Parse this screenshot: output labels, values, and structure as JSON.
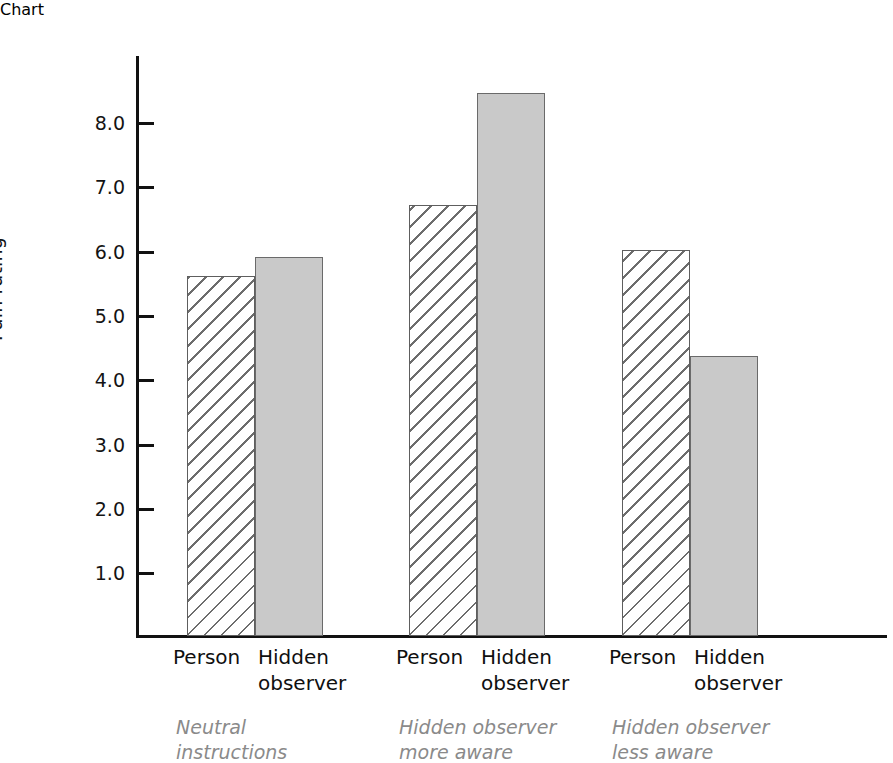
{
  "chart_data": {
    "type": "bar",
    "title": "",
    "xlabel": "",
    "ylabel": "Pain rating",
    "ylim": [
      0,
      8.9
    ],
    "grid": false,
    "legend": "none",
    "categories": [
      "Neutral instructions",
      "Hidden observer more aware",
      "Hidden observer less aware"
    ],
    "series": [
      {
        "name": "Person",
        "values": [
          5.6,
          6.7,
          6.0
        ]
      },
      {
        "name": "Hidden observer",
        "values": [
          5.9,
          8.45,
          4.35
        ]
      }
    ],
    "ytick_labels": [
      "8.0",
      "7.0",
      "6.0",
      "5.0",
      "4.0",
      "3.0",
      "2.0",
      "1.0"
    ],
    "ytick_values": [
      8.0,
      7.0,
      6.0,
      5.0,
      4.0,
      3.0,
      2.0,
      1.0
    ]
  },
  "axis": {
    "y_label": "Pain rating",
    "ticks": [
      {
        "label": "8.0",
        "value": 8.0
      },
      {
        "label": "7.0",
        "value": 7.0
      },
      {
        "label": "6.0",
        "value": 6.0
      },
      {
        "label": "5.0",
        "value": 5.0
      },
      {
        "label": "4.0",
        "value": 4.0
      },
      {
        "label": "3.0",
        "value": 3.0
      },
      {
        "label": "2.0",
        "value": 2.0
      },
      {
        "label": "1.0",
        "value": 1.0
      }
    ]
  },
  "groups": [
    {
      "caption": "Neutral\ninstructions",
      "bars": [
        {
          "label": "Person",
          "value": 5.6,
          "style": "hatched"
        },
        {
          "label": "Hidden\nobserver",
          "value": 5.9,
          "style": "solid"
        }
      ]
    },
    {
      "caption": "Hidden observer\nmore aware",
      "bars": [
        {
          "label": "Person",
          "value": 6.7,
          "style": "hatched"
        },
        {
          "label": "Hidden\nobserver",
          "value": 8.45,
          "style": "solid"
        }
      ]
    },
    {
      "caption": "Hidden observer\nless aware",
      "bars": [
        {
          "label": "Person",
          "value": 6.0,
          "style": "hatched"
        },
        {
          "label": "Hidden\nobserver",
          "value": 4.35,
          "style": "solid"
        }
      ]
    }
  ],
  "colors": {
    "solid_fill": "#c9c9c9",
    "hatch_line": "#6d6d6d",
    "axis": "#111111",
    "label_text": "#0f0f0f",
    "group_caption_text": "#8a8a8a"
  }
}
